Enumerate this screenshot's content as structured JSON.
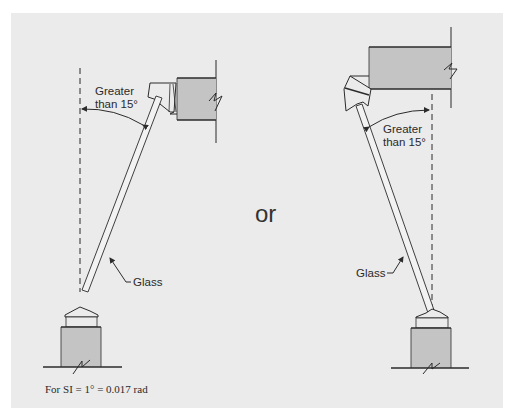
{
  "figure": {
    "background_color": "#ebebeb",
    "block_fill_color": "#c4c4c4",
    "line_color": "#2b2b2b",
    "separator_label": "or",
    "footnote": "For SI = 1° = 0.017 rad"
  },
  "left_detail": {
    "angle_label_line1": "Greater",
    "angle_label_line2": "than 15°",
    "glass_label": "Glass",
    "description": "Glass sloped outward from bottom sill toward head, angle from vertical"
  },
  "right_detail": {
    "angle_label_line1": "Greater",
    "angle_label_line2": "than 15°",
    "glass_label": "Glass",
    "description": "Glass sloped inward from bottom sill toward head, angle from vertical"
  }
}
